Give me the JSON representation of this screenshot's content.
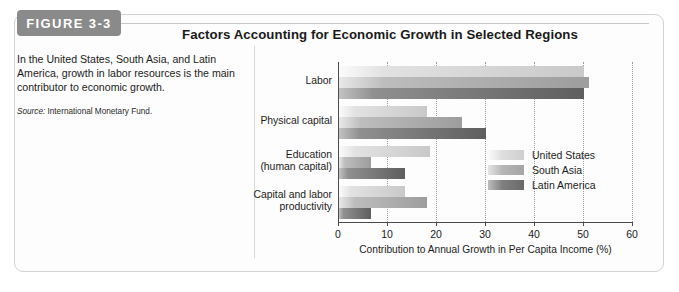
{
  "figure": {
    "badge": "FIGURE 3-3",
    "title": "Factors Accounting for Economic Growth in Selected Regions",
    "caption": "In the United States, South Asia, and Latin America, growth in labor resources is the main contributor to economic growth.",
    "source_label": "Source:",
    "source_text": "International Monetary Fund."
  },
  "chart_data": {
    "type": "bar",
    "orientation": "horizontal",
    "title": "Factors Accounting for Economic Growth in Selected Regions",
    "xlabel": "Contribution to Annual Growth in Per Capita Income (%)",
    "ylabel": "",
    "xlim": [
      0,
      60
    ],
    "xticks": [
      0,
      10,
      20,
      30,
      40,
      50,
      60
    ],
    "xtick_labels": [
      "0",
      "10",
      "20",
      "30",
      "40",
      "50",
      "60"
    ],
    "grid": "vertical-dotted",
    "legend_position": "inside-right",
    "categories": [
      "Labor",
      "Physical capital",
      "Education\n(human capital)",
      "Capital and labor\nproductivity"
    ],
    "category_lines": [
      [
        "Labor"
      ],
      [
        "Physical capital"
      ],
      [
        "Education",
        "(human capital)"
      ],
      [
        "Capital and labor",
        "productivity"
      ]
    ],
    "series": [
      {
        "name": "United States",
        "color": "#dedede",
        "values": [
          50,
          18,
          18.5,
          13.5
        ]
      },
      {
        "name": "South Asia",
        "color": "#b0b0b0",
        "values": [
          51,
          25,
          6.5,
          18
        ]
      },
      {
        "name": "Latin America",
        "color": "#6f6f6f",
        "values": [
          50,
          30,
          13.5,
          6.5
        ]
      }
    ]
  }
}
